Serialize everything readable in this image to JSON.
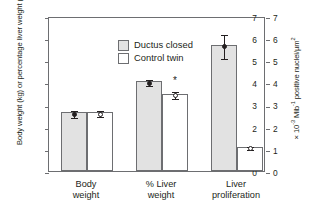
{
  "chart_data": {
    "type": "bar",
    "title": "",
    "subtitle": "",
    "xlabel": "",
    "ylabel": "Body weight (kg) or percentage liver weight (%)",
    "ylabel_right_pre": "× 10",
    "ylabel_right_exp1": "-3",
    "ylabel_right_mid": " Mib",
    "ylabel_right_exp2": "-1",
    "ylabel_right_post": " positive nuclei/µm",
    "ylabel_right_exp3": "2",
    "ylim": [
      0,
      7
    ],
    "ylim_right": [
      0,
      7
    ],
    "yticks": [
      "0",
      "1",
      "2",
      "3",
      "4",
      "5",
      "6",
      "7"
    ],
    "yticks_right": [
      "0",
      "1",
      "2",
      "3",
      "4",
      "5",
      "6",
      "7"
    ],
    "grid": false,
    "legend_position": "upper-left-inside",
    "categories": [
      "Body weight",
      "% Liver weight",
      "Liver proliferation"
    ],
    "category_lines": [
      [
        "Body",
        "weight"
      ],
      [
        "% Liver",
        "weight"
      ],
      [
        "Liver",
        "proliferation"
      ]
    ],
    "series": [
      {
        "name": "Ductus closed",
        "color": "#e2e2e2",
        "marker": "filled-circle",
        "values": [
          2.65,
          4.05,
          5.7
        ],
        "errors": [
          0.17,
          0.13,
          0.55
        ],
        "significance": [
          "",
          "",
          ""
        ]
      },
      {
        "name": "Control twin",
        "color": "#ffffff",
        "marker": "open-circle",
        "values": [
          2.65,
          3.5,
          1.1
        ],
        "errors": [
          0.14,
          0.14,
          0.08
        ],
        "significance": [
          "",
          "*",
          ""
        ]
      }
    ],
    "annotations": [
      {
        "text": "*",
        "group": "% Liver weight",
        "series": "Control twin",
        "meaning": "significant difference"
      }
    ],
    "colors": {
      "axis": "#6d6e71",
      "text": "#231f20",
      "ductus_closed_fill": "#e2e2e2",
      "control_twin_fill": "#ffffff",
      "marker_filled": "#231f20",
      "marker_open": "#ffffff"
    }
  },
  "legend": {
    "items": [
      {
        "label": "Ductus closed"
      },
      {
        "label": "Control twin"
      }
    ]
  }
}
